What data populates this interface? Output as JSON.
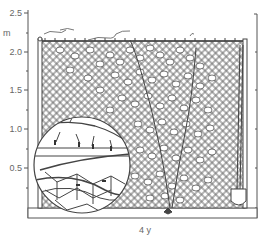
{
  "figure": {
    "type": "technical-illustration",
    "y_axis": {
      "unit": "m",
      "ticks": [
        {
          "label": "2.5",
          "y": 13
        },
        {
          "label": "2.0",
          "y": 52
        },
        {
          "label": "1.5",
          "y": 90
        },
        {
          "label": "1.0",
          "y": 129
        },
        {
          "label": "0.5",
          "y": 168
        }
      ],
      "minor_ticks_y": [
        33,
        71,
        110,
        149,
        188,
        208
      ]
    },
    "x_label": "4 y",
    "elements": {
      "fence": "chain-link fence with posts",
      "vine": "climbing plant with leaves covering fence",
      "inset": "magnifier circle showing vine tendrils attached to wire mesh",
      "tool": "spade leaning against right post"
    },
    "colors": {
      "line": "#555555",
      "text": "#666666",
      "background": "#ffffff"
    }
  }
}
